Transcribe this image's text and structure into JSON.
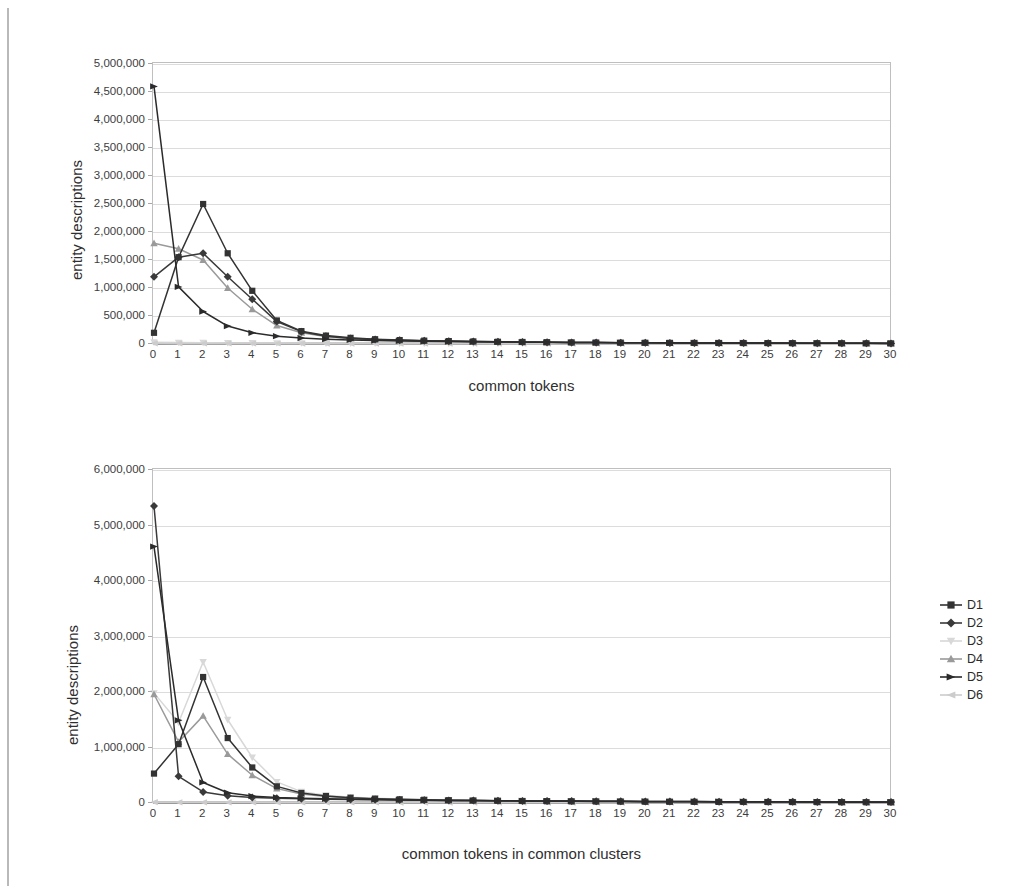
{
  "page": {
    "cut_off_heading": "",
    "background_color": "#ffffff"
  },
  "legend": {
    "position": "right",
    "items": [
      {
        "label": "D1",
        "color": "#333333",
        "marker": "square"
      },
      {
        "label": "D2",
        "color": "#3a3a3a",
        "marker": "diamond"
      },
      {
        "label": "D3",
        "color": "#d8d8d8",
        "marker": "triangle-down"
      },
      {
        "label": "D4",
        "color": "#9a9a9a",
        "marker": "triangle-up"
      },
      {
        "label": "D5",
        "color": "#2b2b2b",
        "marker": "triangle-right"
      },
      {
        "label": "D6",
        "color": "#cccccc",
        "marker": "triangle-left"
      }
    ]
  },
  "chart_data": [
    {
      "id": "top",
      "type": "line",
      "title": "",
      "xlabel": "common tokens",
      "ylabel": "entity descriptions",
      "grid": true,
      "legend_position": "right",
      "xlim": [
        0,
        30
      ],
      "ylim": [
        0,
        5000000
      ],
      "ytick_step": 500000,
      "x": [
        0,
        1,
        2,
        3,
        4,
        5,
        6,
        7,
        8,
        9,
        10,
        11,
        12,
        13,
        14,
        15,
        16,
        17,
        18,
        19,
        20,
        21,
        22,
        23,
        24,
        25,
        26,
        27,
        28,
        29,
        30
      ],
      "xticklabels": [
        "0",
        "1",
        "2",
        "3",
        "4",
        "5",
        "6",
        "7",
        "8",
        "9",
        "10",
        "11",
        "12",
        "13",
        "14",
        "15",
        "16",
        "17",
        "18",
        "19",
        "20",
        "21",
        "22",
        "23",
        "24",
        "25",
        "26",
        "27",
        "28",
        "29",
        "30"
      ],
      "yticklabels": [
        "0",
        "500,000",
        "1,000,000",
        "1,500,000",
        "2,000,000",
        "2,500,000",
        "3,000,000",
        "3,500,000",
        "4,000,000",
        "4,500,000",
        "5,000,000"
      ],
      "series": [
        {
          "name": "D1",
          "color": "#333333",
          "marker": "square",
          "values": [
            200000,
            1550000,
            2500000,
            1620000,
            950000,
            420000,
            230000,
            150000,
            110000,
            85000,
            70000,
            60000,
            52000,
            46000,
            40000,
            36000,
            32000,
            29000,
            26000,
            24000,
            22000,
            20000,
            19000,
            18000,
            17000,
            16000,
            15000,
            14000,
            13000,
            12000,
            11000
          ]
        },
        {
          "name": "D2",
          "color": "#3a3a3a",
          "marker": "diamond",
          "values": [
            1200000,
            1550000,
            1620000,
            1200000,
            800000,
            400000,
            220000,
            140000,
            100000,
            80000,
            66000,
            56000,
            48000,
            43000,
            38000,
            34000,
            31000,
            28000,
            25000,
            23000,
            21000,
            20000,
            18500,
            17500,
            16500,
            15500,
            14500,
            13500,
            12500,
            11500,
            10500
          ]
        },
        {
          "name": "D3",
          "color": "#d8d8d8",
          "marker": "triangle-down",
          "values": [
            30000,
            25000,
            22000,
            20000,
            18000,
            16000,
            15000,
            14000,
            13000,
            12000,
            11000,
            10000,
            9500,
            9000,
            8500,
            8000,
            7500,
            7000,
            6800,
            6500,
            6200,
            6000,
            5800,
            5600,
            5400,
            5200,
            5000,
            4800,
            4600,
            4400,
            4200
          ]
        },
        {
          "name": "D4",
          "color": "#9a9a9a",
          "marker": "triangle-up",
          "values": [
            1800000,
            1700000,
            1500000,
            1000000,
            620000,
            330000,
            200000,
            135000,
            100000,
            80000,
            66000,
            56000,
            48000,
            43000,
            38000,
            34000,
            31000,
            28000,
            25000,
            23000,
            21000,
            20000,
            18500,
            17500,
            16500,
            15500,
            14500,
            13500,
            12500,
            11500,
            10500
          ]
        },
        {
          "name": "D5",
          "color": "#2b2b2b",
          "marker": "triangle-right",
          "values": [
            4600000,
            1020000,
            580000,
            320000,
            200000,
            140000,
            105000,
            85000,
            72000,
            62000,
            55000,
            49000,
            44000,
            40000,
            36000,
            33000,
            30000,
            28000,
            26000,
            24000,
            22000,
            21000,
            20000,
            19000,
            18000,
            17000,
            16000,
            15000,
            14000,
            13000,
            12000
          ]
        },
        {
          "name": "D6",
          "color": "#cccccc",
          "marker": "triangle-left",
          "values": [
            12000,
            11000,
            10500,
            10000,
            9500,
            9000,
            8500,
            8200,
            8000,
            7800,
            7500,
            7200,
            7000,
            6800,
            6600,
            6400,
            6200,
            6000,
            5800,
            5600,
            5400,
            5200,
            5000,
            4800,
            4600,
            4400,
            4200,
            4000,
            3800,
            3600,
            3400
          ]
        }
      ]
    },
    {
      "id": "bottom",
      "type": "line",
      "title": "",
      "xlabel": "common tokens in common clusters",
      "ylabel": "entity descriptions",
      "grid": true,
      "legend_position": "right",
      "xlim": [
        0,
        30
      ],
      "ylim": [
        0,
        6000000
      ],
      "ytick_step": 1000000,
      "x": [
        0,
        1,
        2,
        3,
        4,
        5,
        6,
        7,
        8,
        9,
        10,
        11,
        12,
        13,
        14,
        15,
        16,
        17,
        18,
        19,
        20,
        21,
        22,
        23,
        24,
        25,
        26,
        27,
        28,
        29,
        30
      ],
      "xticklabels": [
        "0",
        "1",
        "2",
        "3",
        "4",
        "5",
        "6",
        "7",
        "8",
        "9",
        "10",
        "11",
        "12",
        "13",
        "14",
        "15",
        "16",
        "17",
        "18",
        "19",
        "20",
        "21",
        "22",
        "23",
        "24",
        "25",
        "26",
        "27",
        "28",
        "29",
        "30"
      ],
      "yticklabels": [
        "0",
        "1,000,000",
        "2,000,000",
        "3,000,000",
        "4,000,000",
        "5,000,000",
        "6,000,000"
      ],
      "series": [
        {
          "name": "D1",
          "color": "#333333",
          "marker": "square",
          "values": [
            530000,
            1060000,
            2270000,
            1170000,
            640000,
            300000,
            180000,
            125000,
            95000,
            78000,
            66000,
            57000,
            50000,
            45000,
            40000,
            36000,
            33000,
            30000,
            28000,
            26000,
            24000,
            22500,
            21000,
            20000,
            19000,
            18000,
            17000,
            16000,
            15000,
            14000,
            13000
          ]
        },
        {
          "name": "D2",
          "color": "#3a3a3a",
          "marker": "diamond",
          "values": [
            5350000,
            480000,
            200000,
            130000,
            100000,
            85000,
            75000,
            68000,
            62000,
            58000,
            54000,
            50000,
            47000,
            44000,
            41000,
            38000,
            36000,
            34000,
            32000,
            30000,
            28000,
            26500,
            25000,
            24000,
            23000,
            22000,
            21000,
            20000,
            19000,
            18000,
            17000
          ]
        },
        {
          "name": "D3",
          "color": "#d8d8d8",
          "marker": "triangle-down",
          "values": [
            1980000,
            1450000,
            2540000,
            1500000,
            820000,
            380000,
            205000,
            140000,
            105000,
            85000,
            70000,
            60000,
            53000,
            47000,
            42000,
            38000,
            34000,
            31000,
            29000,
            27000,
            25000,
            23500,
            22000,
            21000,
            20000,
            19000,
            18000,
            17000,
            16000,
            15000,
            14000
          ]
        },
        {
          "name": "D4",
          "color": "#9a9a9a",
          "marker": "triangle-up",
          "values": [
            1960000,
            1100000,
            1570000,
            880000,
            500000,
            260000,
            160000,
            115000,
            90000,
            74000,
            63000,
            55000,
            48000,
            43000,
            39000,
            35000,
            32000,
            30000,
            28000,
            26000,
            24000,
            22500,
            21000,
            20000,
            19000,
            18000,
            17000,
            16000,
            15000,
            14000,
            13000
          ]
        },
        {
          "name": "D5",
          "color": "#2b2b2b",
          "marker": "triangle-right",
          "values": [
            4620000,
            1490000,
            370000,
            185000,
            125000,
            100000,
            85000,
            75000,
            67000,
            61000,
            56000,
            51000,
            47000,
            44000,
            41000,
            38000,
            36000,
            34000,
            32000,
            30000,
            28000,
            26500,
            25000,
            24000,
            23000,
            22000,
            21000,
            20000,
            19000,
            18000,
            17000
          ]
        },
        {
          "name": "D6",
          "color": "#cccccc",
          "marker": "triangle-left",
          "values": [
            14000,
            13000,
            12500,
            12000,
            11500,
            11000,
            10500,
            10000,
            9600,
            9200,
            8800,
            8500,
            8200,
            7900,
            7600,
            7300,
            7000,
            6800,
            6600,
            6400,
            6200,
            6000,
            5800,
            5600,
            5400,
            5200,
            5000,
            4800,
            4600,
            4400,
            4200
          ]
        }
      ]
    }
  ]
}
